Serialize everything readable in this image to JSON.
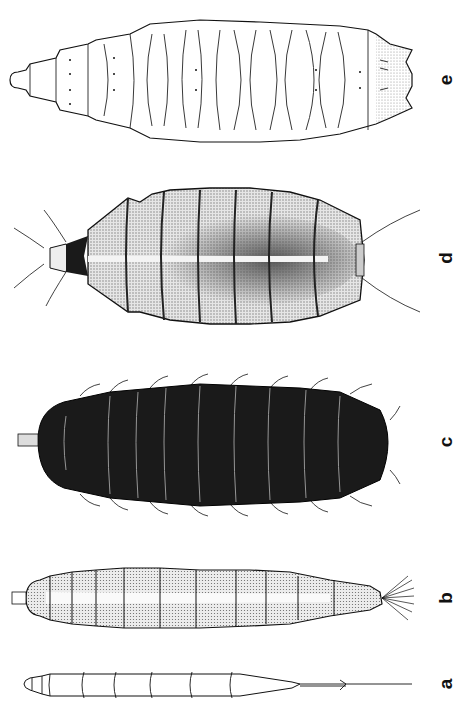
{
  "figure": {
    "panels": [
      {
        "id": "e",
        "label": "e",
        "style": "outlined, pale, segmented with lobed lateral margins"
      },
      {
        "id": "d",
        "label": "d",
        "style": "stippled, flattened, with hatched margins and long setae"
      },
      {
        "id": "c",
        "label": "c",
        "style": "dark/black, bristly, segmented"
      },
      {
        "id": "b",
        "label": "b",
        "style": "stippled, elongate, with terminal tuft of hairs"
      },
      {
        "id": "a",
        "label": "a",
        "style": "pale, slender, with long caudal filament"
      }
    ]
  },
  "colors": {
    "background": "#ffffff",
    "ink": "#111111",
    "dark_body": "#1a1a1a",
    "stipple": "#8a8a8a"
  }
}
